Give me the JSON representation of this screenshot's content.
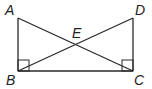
{
  "diagram": {
    "type": "geometry",
    "points": {
      "A": {
        "label": "A",
        "x": 18,
        "y": 18
      },
      "B": {
        "label": "B",
        "x": 18,
        "y": 71
      },
      "C": {
        "label": "C",
        "x": 133,
        "y": 71
      },
      "D": {
        "label": "D",
        "x": 133,
        "y": 18
      },
      "E": {
        "label": "E",
        "x": 76,
        "y": 44
      }
    },
    "segments": [
      "AB",
      "BC",
      "CD",
      "AC",
      "BD"
    ],
    "right_angles": [
      "B",
      "C"
    ]
  }
}
